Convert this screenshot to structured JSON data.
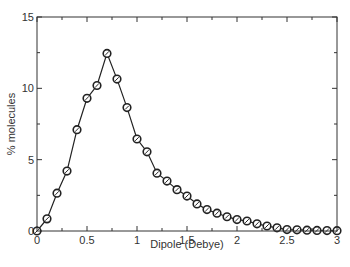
{
  "chart_data": {
    "type": "line",
    "title": "",
    "xlabel": "Dipole (Debye)",
    "ylabel": "% molecules",
    "xlim": [
      0,
      3
    ],
    "ylim": [
      0,
      15
    ],
    "x_ticks": [
      0,
      0.5,
      1,
      1.5,
      2,
      2.5,
      3
    ],
    "x_tick_labels": [
      "0",
      "0.5",
      "1",
      "1.5",
      "2",
      "2.5",
      "3"
    ],
    "y_ticks": [
      0,
      5,
      10,
      15
    ],
    "y_tick_labels": [
      "0",
      "5",
      "10",
      "15"
    ],
    "grid": false,
    "legend": null,
    "marker": "open-circle",
    "series": [
      {
        "name": "distribution",
        "x": [
          0,
          0.1,
          0.2,
          0.3,
          0.4,
          0.5,
          0.6,
          0.7,
          0.8,
          0.9,
          1.0,
          1.1,
          1.2,
          1.3,
          1.4,
          1.5,
          1.6,
          1.7,
          1.8,
          1.9,
          2.0,
          2.1,
          2.2,
          2.3,
          2.4,
          2.5,
          2.6,
          2.7,
          2.8,
          2.9,
          3.0
        ],
        "values": [
          0.0,
          0.85,
          2.65,
          4.2,
          7.1,
          9.3,
          10.2,
          12.45,
          10.65,
          8.65,
          6.45,
          5.55,
          4.05,
          3.5,
          2.9,
          2.45,
          1.9,
          1.5,
          1.25,
          1.0,
          0.8,
          0.7,
          0.5,
          0.35,
          0.22,
          0.1,
          0.08,
          0.06,
          0.04,
          0.03,
          0.02
        ]
      }
    ]
  },
  "colors": {
    "line": "#222222",
    "axis": "#333333",
    "background": "#ffffff"
  }
}
